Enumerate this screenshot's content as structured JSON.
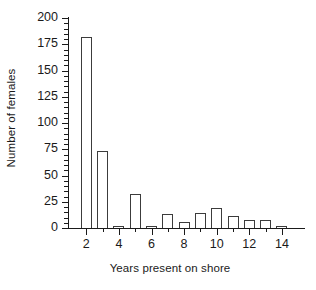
{
  "chart_data": {
    "type": "bar",
    "title": "",
    "xlabel": "Years present on shore",
    "ylabel": "Number of females",
    "categories": [
      2,
      3,
      4,
      5,
      6,
      7,
      8,
      9,
      10,
      11,
      12,
      13,
      14
    ],
    "values": [
      182,
      73,
      2,
      32,
      1,
      13,
      6,
      14,
      19,
      11,
      8,
      8,
      1
    ],
    "xlim": [
      1,
      15
    ],
    "ylim": [
      0,
      200
    ],
    "ytick_labels": [
      "0",
      "25",
      "50",
      "75",
      "100",
      "125",
      "150",
      "175",
      "200"
    ],
    "ytick_values": [
      0,
      25,
      50,
      75,
      100,
      125,
      150,
      175,
      200
    ],
    "ytick_minor_step": 5,
    "xtick_labels": [
      "2",
      "4",
      "6",
      "8",
      "10",
      "12",
      "14"
    ],
    "xtick_values": [
      2,
      4,
      6,
      8,
      10,
      12,
      14
    ],
    "xtick_minor_values": [
      3,
      5,
      7,
      9,
      11,
      13
    ],
    "grid": false,
    "legend": false,
    "bar_fill_color": "#ffffff",
    "bar_edge_color": "#3c3c3c",
    "axis_color": "#1a1a1a",
    "background_color": "#ffffff"
  }
}
